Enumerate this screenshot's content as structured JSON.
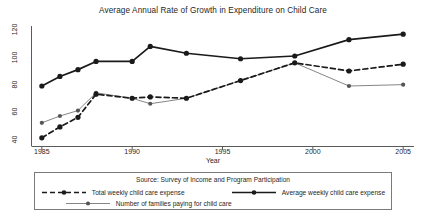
{
  "chart_data": {
    "type": "line",
    "title": "Average Annual Rate of Growth in Expenditure on Child Care",
    "xlabel": "Year",
    "ylabel": "",
    "xlim": [
      1984.4,
      2005.6
    ],
    "ylim": [
      36,
      124
    ],
    "xticks": [
      1985,
      1990,
      1995,
      2000,
      2005
    ],
    "yticks": [
      40,
      60,
      80,
      100,
      120
    ],
    "grid": false,
    "legend_position": "bottom",
    "annotations": [
      "Source: Survey of Income and Program Participation"
    ],
    "series": [
      {
        "name": "Total weekly child care expense",
        "style": "dashed",
        "color": "#1a1a1a",
        "x": [
          1985,
          1986,
          1987,
          1988,
          1990,
          1991,
          1993,
          1996,
          1999,
          2002,
          2005
        ],
        "values": [
          42,
          50,
          57,
          74,
          71,
          72,
          71,
          84,
          97,
          91,
          96
        ]
      },
      {
        "name": "Average weekly child care expense",
        "style": "solid-thick",
        "color": "#1a1a1a",
        "x": [
          1985,
          1986,
          1987,
          1988,
          1990,
          1991,
          1993,
          1996,
          1999,
          2002,
          2005
        ],
        "values": [
          80,
          87,
          92,
          98,
          98,
          109,
          104,
          100,
          102,
          114,
          118
        ]
      },
      {
        "name": "Number of families paying for child care",
        "style": "solid-thin",
        "color": "#777777",
        "x": [
          1985,
          1986,
          1987,
          1988,
          1990,
          1991,
          1993,
          1996,
          1999,
          2002,
          2005
        ],
        "values": [
          53,
          58,
          62,
          75,
          71,
          67,
          71,
          84,
          97,
          80,
          81
        ]
      }
    ]
  },
  "legend": {
    "source": "Source: Survey of Income and Program Participation",
    "entries": [
      {
        "label": "Total weekly child care expense"
      },
      {
        "label": "Average weekly child care expense"
      },
      {
        "label": "Number of families paying for child care"
      }
    ]
  }
}
